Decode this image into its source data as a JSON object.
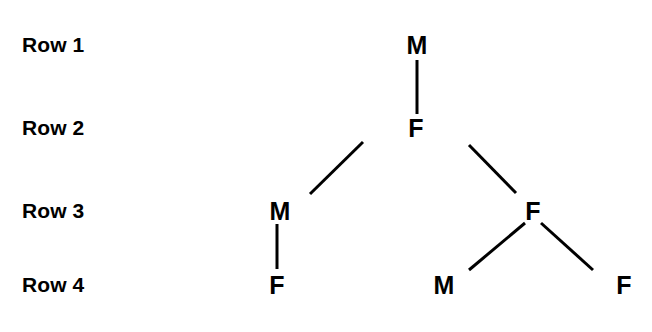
{
  "diagram": {
    "type": "pedigree-tree",
    "title": "",
    "background_color": "#ffffff",
    "ink_color": "#000000",
    "row_labels": [
      {
        "text": "Row 1",
        "x": 22,
        "y": 45
      },
      {
        "text": "Row 2",
        "x": 22,
        "y": 128
      },
      {
        "text": "Row 3",
        "x": 22,
        "y": 211
      },
      {
        "text": "Row 4",
        "x": 22,
        "y": 285
      }
    ],
    "nodes": [
      {
        "id": "n1",
        "label": "M",
        "row": 1,
        "x": 417,
        "y": 45
      },
      {
        "id": "n2",
        "label": "F",
        "row": 2,
        "x": 416,
        "y": 128
      },
      {
        "id": "n3",
        "label": "M",
        "row": 3,
        "x": 280,
        "y": 211
      },
      {
        "id": "n4",
        "label": "F",
        "row": 3,
        "x": 533,
        "y": 211
      },
      {
        "id": "n5",
        "label": "F",
        "row": 4,
        "x": 277,
        "y": 285
      },
      {
        "id": "n6",
        "label": "M",
        "row": 4,
        "x": 444,
        "y": 285
      },
      {
        "id": "n7",
        "label": "F",
        "row": 4,
        "x": 624,
        "y": 285
      }
    ],
    "edges": [
      {
        "from": "n1",
        "to": "n2",
        "x1": 417,
        "y1": 60,
        "x2": 417,
        "y2": 114
      },
      {
        "from": "n2",
        "to": "n3",
        "x1": 363,
        "y1": 142,
        "x2": 310,
        "y2": 194
      },
      {
        "from": "n2",
        "to": "n4",
        "x1": 469,
        "y1": 145,
        "x2": 516,
        "y2": 193
      },
      {
        "from": "n3",
        "to": "n5",
        "x1": 277,
        "y1": 224,
        "x2": 277,
        "y2": 269
      },
      {
        "from": "n4",
        "to": "n6",
        "x1": 525,
        "y1": 223,
        "x2": 469,
        "y2": 270
      },
      {
        "from": "n4",
        "to": "n7",
        "x1": 541,
        "y1": 223,
        "x2": 593,
        "y2": 270
      }
    ]
  }
}
